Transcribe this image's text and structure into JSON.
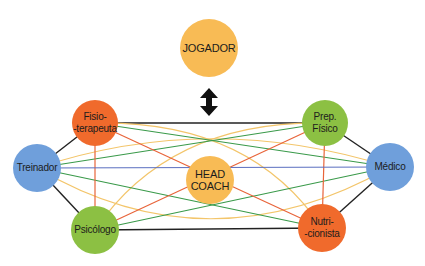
{
  "colors": {
    "orange_node": "#f06a2c",
    "green_node": "#8cc043",
    "blue_node": "#6f9fdb",
    "yellow_node": "#f8bb55",
    "line_black": "#222222",
    "line_blue": "#5b6fc0",
    "line_orange": "#e8643a",
    "line_green": "#3a9a4a",
    "line_yellow": "#f3c56a"
  },
  "nodes": [
    {
      "id": "jogador",
      "label": "JOGADOR",
      "cx": 209,
      "cy": 48,
      "r": 29,
      "color": "#f8bb55"
    },
    {
      "id": "fisioterapeuta",
      "label": "Fisio-\n-terapeuta",
      "cx": 95,
      "cy": 123,
      "r": 23,
      "color": "#f06a2c"
    },
    {
      "id": "prep_fisico",
      "label": "Prep.\nFísico",
      "cx": 325,
      "cy": 123,
      "r": 23,
      "color": "#8cc043"
    },
    {
      "id": "treinador",
      "label": "Treinador",
      "cx": 37,
      "cy": 168,
      "r": 24,
      "color": "#6f9fdb"
    },
    {
      "id": "medico",
      "label": "Médico",
      "cx": 390,
      "cy": 167,
      "r": 24,
      "color": "#6f9fdb"
    },
    {
      "id": "head_coach",
      "label": "HEAD\nCOACH",
      "cx": 210,
      "cy": 180,
      "r": 24,
      "color": "#f8bb55"
    },
    {
      "id": "psicologo",
      "label": "Psicólogo",
      "cx": 95,
      "cy": 230,
      "r": 24,
      "color": "#8cc043"
    },
    {
      "id": "nutricionista",
      "label": "Nutri-\n-cionista",
      "cx": 322,
      "cy": 228,
      "r": 24,
      "color": "#f06a2c"
    }
  ],
  "arrow": {
    "between": [
      "jogador",
      "head_coach_group"
    ],
    "type": "double-vertical-arrow"
  }
}
